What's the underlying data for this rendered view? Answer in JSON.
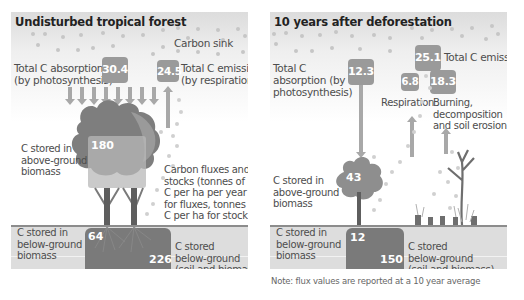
{
  "left_panel": {
    "title": "Undisturbed tropical forest",
    "carbon_sink_label": "Carbon sink",
    "absorption_label": "Total C absorption\n(by photosynthesis)",
    "absorption_value": "30.4",
    "emission_label": "Total C emission\n(by respiration)",
    "emission_value": "24.5",
    "above_ground_label": "C stored in\nabove-ground\nbiomass",
    "above_ground_value": "180",
    "legend_label": "Carbon fluxes and\nstocks (tonnes of\nC per ha per year\nfor fluxes, tonnes of\nC per ha for stock)",
    "below_biomass_label": "C stored in\nbelow-ground\nbiomass",
    "below_biomass_value": "64",
    "below_total_label": "C stored\nbelow-ground\n(soil and biomass)",
    "below_total_value": "226"
  },
  "right_panel": {
    "title": "10 years after deforestation",
    "emission_label": "Total C emission",
    "emission_value": "25.1",
    "absorption_label": "Total C\nabsorption (by\nphotosynthesis)",
    "absorption_value": "12.3",
    "respiration_label": "Respiration",
    "respiration_value": "6.8",
    "burning_label": "Burning,\ndecomposition\nand soil erosion",
    "burning_value": "18.3",
    "above_ground_label": "C stored in\nabove-ground\nbiomass",
    "above_ground_value": "43",
    "below_biomass_label": "C stored in\nbelow-ground\nbiomass",
    "below_biomass_value": "12",
    "below_total_label": "C stored\nbelow-ground\n(soil and biomass)",
    "below_total_value": "150"
  },
  "note": "Note: flux values are reported at a 10 year average",
  "colors": {
    "box": "#9a9a9a",
    "store": "#7a7a7a",
    "ground": "#dddddd",
    "arrow": "#a8a8a8"
  }
}
